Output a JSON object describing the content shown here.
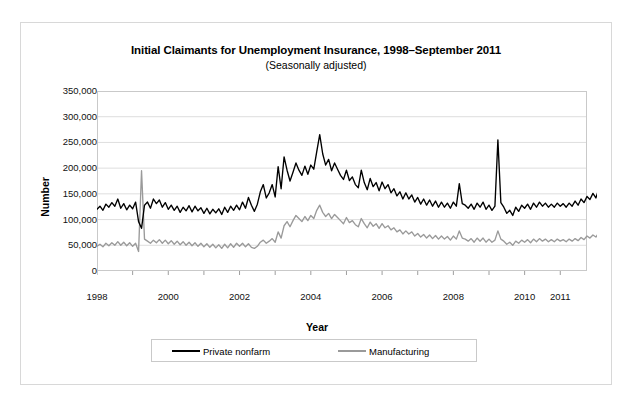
{
  "chart_data": {
    "type": "line",
    "title": "Initial Claimants for Unemployment Insurance, 1998–September 2011",
    "subtitle": "(Seasonally adjusted)",
    "xlabel": "Year",
    "ylabel": "Number",
    "ylim": [
      0,
      350000
    ],
    "ytick_labels": [
      "0",
      "50,000",
      "100,000",
      "150,000",
      "200,000",
      "250,000",
      "300,000",
      "350,000"
    ],
    "ytick_values": [
      0,
      50000,
      100000,
      150000,
      200000,
      250000,
      300000,
      350000
    ],
    "xtick_labels": [
      "1998",
      "2000",
      "2002",
      "2004",
      "2006",
      "2008",
      "2010",
      "2011"
    ],
    "xtick_values": [
      1998,
      2000,
      2002,
      2004,
      2006,
      2008,
      2010,
      2011
    ],
    "xlim": [
      1998.0,
      2011.75
    ],
    "grid": "horizontal",
    "legend_position": "bottom",
    "colors": {
      "private_nonfarm": "#000000",
      "manufacturing": "#9a9a9a"
    },
    "x_start": 1998.0,
    "x_step": 0.08333,
    "series": [
      {
        "name": "Private nonfarm",
        "color": "#000000",
        "values": [
          120000,
          126000,
          118000,
          130000,
          124000,
          133000,
          126000,
          140000,
          122000,
          131000,
          119000,
          128000,
          121000,
          134000,
          96000,
          83000,
          128000,
          134000,
          122000,
          140000,
          131000,
          138000,
          124000,
          133000,
          120000,
          128000,
          118000,
          126000,
          114000,
          124000,
          117000,
          127000,
          115000,
          126000,
          117000,
          123000,
          112000,
          122000,
          111000,
          120000,
          113000,
          121000,
          110000,
          124000,
          114000,
          126000,
          118000,
          128000,
          119000,
          134000,
          122000,
          143000,
          128000,
          116000,
          130000,
          154000,
          168000,
          142000,
          152000,
          168000,
          144000,
          203000,
          160000,
          222000,
          196000,
          175000,
          192000,
          210000,
          196000,
          186000,
          204000,
          188000,
          206000,
          198000,
          232000,
          265000,
          228000,
          206000,
          217000,
          195000,
          210000,
          198000,
          186000,
          178000,
          196000,
          176000,
          183000,
          168000,
          162000,
          196000,
          172000,
          158000,
          180000,
          164000,
          172000,
          156000,
          173000,
          160000,
          168000,
          152000,
          160000,
          146000,
          154000,
          140000,
          152000,
          140000,
          148000,
          134000,
          143000,
          130000,
          140000,
          128000,
          138000,
          126000,
          136000,
          124000,
          134000,
          124000,
          132000,
          122000,
          134000,
          126000,
          170000,
          131000,
          128000,
          122000,
          130000,
          120000,
          132000,
          124000,
          134000,
          120000,
          128000,
          118000,
          126000,
          255000,
          133000,
          124000,
          112000,
          118000,
          108000,
          124000,
          116000,
          128000,
          122000,
          130000,
          120000,
          132000,
          124000,
          134000,
          126000,
          132000,
          124000,
          130000,
          124000,
          132000,
          126000,
          131000,
          124000,
          132000,
          126000,
          136000,
          128000,
          140000,
          133000,
          145000,
          139000,
          151000,
          142000,
          160000,
          148000,
          172000,
          152000,
          142000,
          165000,
          157000,
          170000,
          186000,
          178000,
          194000,
          212000,
          232000,
          225000,
          248000,
          301000,
          252000,
          276000,
          238000,
          224000,
          221000,
          212000,
          196000,
          178000,
          168000,
          172000,
          158000,
          166000,
          150000,
          156000,
          145000,
          152000,
          140000,
          148000,
          136000,
          144000,
          130000,
          142000,
          133000,
          140000,
          126000,
          136000,
          124000,
          130000,
          132000,
          142000,
          136000,
          138000,
          132000,
          136000,
          140000,
          136000,
          142000,
          137000,
          141000,
          140000
        ]
      },
      {
        "name": "Manufacturing",
        "color": "#9a9a9a",
        "values": [
          48000,
          52000,
          47000,
          54000,
          49000,
          55000,
          50000,
          57000,
          50000,
          56000,
          49000,
          55000,
          48000,
          54000,
          38000,
          195000,
          62000,
          58000,
          54000,
          60000,
          55000,
          61000,
          54000,
          60000,
          53000,
          59000,
          52000,
          58000,
          51000,
          57000,
          50000,
          56000,
          49000,
          55000,
          48000,
          54000,
          47000,
          53000,
          46000,
          52000,
          45000,
          51000,
          44000,
          52000,
          45000,
          53000,
          46000,
          54000,
          48000,
          54000,
          47000,
          53000,
          46000,
          44000,
          48000,
          56000,
          60000,
          54000,
          58000,
          63000,
          56000,
          76000,
          64000,
          88000,
          96000,
          86000,
          98000,
          108000,
          102000,
          96000,
          106000,
          98000,
          108000,
          102000,
          118000,
          128000,
          114000,
          106000,
          112000,
          102000,
          110000,
          104000,
          98000,
          92000,
          104000,
          94000,
          98000,
          90000,
          86000,
          102000,
          92000,
          84000,
          95000,
          87000,
          92000,
          83000,
          92000,
          84000,
          88000,
          80000,
          84000,
          76000,
          80000,
          72000,
          78000,
          72000,
          76000,
          68000,
          73000,
          66000,
          71000,
          64000,
          70000,
          63000,
          69000,
          62000,
          68000,
          62000,
          67000,
          60000,
          68000,
          62000,
          78000,
          64000,
          62000,
          58000,
          63000,
          56000,
          64000,
          58000,
          64000,
          56000,
          62000,
          56000,
          60000,
          78000,
          62000,
          58000,
          52000,
          56000,
          50000,
          58000,
          54000,
          60000,
          56000,
          61000,
          55000,
          62000,
          57000,
          63000,
          58000,
          62000,
          57000,
          61000,
          57000,
          62000,
          58000,
          61000,
          57000,
          62000,
          58000,
          63000,
          59000,
          65000,
          61000,
          68000,
          64000,
          70000,
          66000,
          74000,
          69000,
          80000,
          71000,
          66000,
          77000,
          73000,
          80000,
          88000,
          84000,
          92000,
          102000,
          114000,
          110000,
          122000,
          148000,
          124000,
          140000,
          118000,
          110000,
          104000,
          96000,
          88000,
          78000,
          72000,
          74000,
          66000,
          70000,
          62000,
          66000,
          60000,
          64000,
          58000,
          62000,
          55000,
          60000,
          52000,
          58000,
          54000,
          57000,
          48000,
          53000,
          46000,
          49000,
          51000,
          56000,
          52000,
          54000,
          50000,
          52000,
          54000,
          52000,
          55000,
          52000,
          54000,
          54000
        ]
      }
    ]
  },
  "legend": {
    "items": [
      {
        "label": "Private nonfarm",
        "color": "#000000"
      },
      {
        "label": "Manufacturing",
        "color": "#9a9a9a"
      }
    ]
  }
}
